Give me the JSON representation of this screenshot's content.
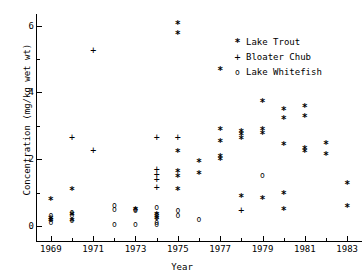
{
  "chart_data": {
    "type": "scatter",
    "title": "",
    "xlabel": "Year",
    "ylabel": "Concentration (mg/kg wet wt)",
    "xlim": [
      1968.3,
      1983.7
    ],
    "ylim": [
      -0.45,
      6.35
    ],
    "grid": false,
    "legend_position": "top-right",
    "xticks_major": [
      1969,
      1971,
      1973,
      1975,
      1977,
      1979,
      1981,
      1983
    ],
    "xticks_minor": [
      1970,
      1972,
      1974,
      1976,
      1978,
      1980,
      1982
    ],
    "xtick_labels": [
      "1969",
      "1971",
      "1973",
      "1975",
      "1977",
      "1979",
      "1981",
      "1983"
    ],
    "yticks_major": [
      0,
      2,
      4,
      6
    ],
    "yticks_minor": [
      1,
      3,
      5
    ],
    "ytick_labels": [
      "0",
      "2",
      "4",
      "6"
    ],
    "series": [
      {
        "name": "Lake Trout",
        "marker": "*",
        "marker_name": "asterisk-marker",
        "color": "#000000",
        "points": [
          [
            1969,
            0.75
          ],
          [
            1969,
            0.2
          ],
          [
            1969,
            0.12
          ],
          [
            1970,
            1.05
          ],
          [
            1970,
            0.3
          ],
          [
            1970,
            0.12
          ],
          [
            1973,
            0.45
          ],
          [
            1974,
            0.3
          ],
          [
            1974,
            0.2
          ],
          [
            1975,
            6.05
          ],
          [
            1975,
            5.75
          ],
          [
            1975,
            2.2
          ],
          [
            1975,
            1.6
          ],
          [
            1975,
            1.45
          ],
          [
            1975,
            1.05
          ],
          [
            1976,
            1.9
          ],
          [
            1976,
            1.55
          ],
          [
            1977,
            4.65
          ],
          [
            1977,
            2.85
          ],
          [
            1977,
            2.5
          ],
          [
            1977,
            2.05
          ],
          [
            1977,
            1.95
          ],
          [
            1978,
            2.8
          ],
          [
            1978,
            2.7
          ],
          [
            1978,
            2.6
          ],
          [
            1978,
            0.85
          ],
          [
            1979,
            3.7
          ],
          [
            1979,
            2.85
          ],
          [
            1979,
            2.75
          ],
          [
            1979,
            0.8
          ],
          [
            1980,
            3.45
          ],
          [
            1980,
            3.2
          ],
          [
            1980,
            2.4
          ],
          [
            1980,
            0.95
          ],
          [
            1980,
            0.45
          ],
          [
            1981,
            3.55
          ],
          [
            1981,
            3.25
          ],
          [
            1981,
            2.3
          ],
          [
            1981,
            2.2
          ],
          [
            1982,
            2.45
          ],
          [
            1982,
            2.1
          ],
          [
            1983,
            1.25
          ],
          [
            1983,
            0.55
          ]
        ]
      },
      {
        "name": "Bloater Chub",
        "marker": "+",
        "marker_name": "plus-marker",
        "color": "#000000",
        "points": [
          [
            1970,
            2.65
          ],
          [
            1971,
            5.25
          ],
          [
            1971,
            2.25
          ],
          [
            1974,
            2.65
          ],
          [
            1974,
            1.7
          ],
          [
            1974,
            1.55
          ],
          [
            1974,
            1.4
          ],
          [
            1974,
            1.15
          ],
          [
            1975,
            2.65
          ],
          [
            1978,
            0.45
          ]
        ]
      },
      {
        "name": "Lake Whitefish",
        "marker": "o",
        "marker_name": "circle-marker",
        "color": "#000000",
        "points": [
          [
            1969,
            0.3
          ],
          [
            1969,
            0.2
          ],
          [
            1969,
            0.1
          ],
          [
            1970,
            0.4
          ],
          [
            1970,
            0.3
          ],
          [
            1970,
            0.15
          ],
          [
            1972,
            0.6
          ],
          [
            1972,
            0.5
          ],
          [
            1972,
            0.05
          ],
          [
            1973,
            0.5
          ],
          [
            1973,
            0.45
          ],
          [
            1973,
            0.05
          ],
          [
            1974,
            0.55
          ],
          [
            1974,
            0.35
          ],
          [
            1974,
            0.25
          ],
          [
            1974,
            0.1
          ],
          [
            1974,
            0.05
          ],
          [
            1975,
            0.45
          ],
          [
            1975,
            0.3
          ],
          [
            1976,
            0.2
          ],
          [
            1979,
            1.5
          ]
        ]
      }
    ]
  },
  "legend": {
    "entries": [
      {
        "symbol": "*",
        "label": "Lake Trout",
        "key": "lake-trout"
      },
      {
        "symbol": "+",
        "label": "Bloater Chub",
        "key": "bloater-chub"
      },
      {
        "symbol": "o",
        "label": "Lake Whitefish",
        "key": "lake-whitefish"
      }
    ]
  }
}
